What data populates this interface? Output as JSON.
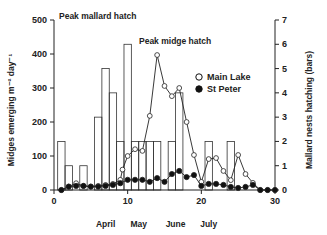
{
  "chart_data": {
    "type": "bar+line",
    "title": "",
    "xlabel": "",
    "ylabel": "Midges emerging m⁻² day⁻¹",
    "y2label": "Mallard nests hatching (bars)",
    "xlim": [
      0,
      30
    ],
    "ylim": [
      0,
      500
    ],
    "y2lim": [
      0,
      7
    ],
    "x_ticks": [
      0,
      10,
      20,
      30
    ],
    "y_ticks": [
      0,
      100,
      200,
      300,
      400,
      500
    ],
    "y2_ticks": [
      0,
      1,
      2,
      3,
      4,
      5,
      6,
      7
    ],
    "month_labels": [
      {
        "label": "April",
        "x": 7
      },
      {
        "label": "May",
        "x": 11.5
      },
      {
        "label": "June",
        "x": 16.5
      },
      {
        "label": "July",
        "x": 21
      }
    ],
    "annotations": [
      {
        "text": "Peak mallard hatch",
        "x": 0.3,
        "y": 500
      },
      {
        "text": "Peak midge hatch",
        "x": 10.5,
        "y": 430
      }
    ],
    "legend": {
      "position": "right",
      "entries": [
        {
          "label": "Main Lake",
          "marker": "open-circle"
        },
        {
          "label": "St Peter",
          "marker": "filled-circle"
        }
      ]
    },
    "bars": {
      "name": "Mallard nests hatching",
      "axis": "right",
      "x": [
        1,
        2,
        4,
        6,
        7,
        8,
        9,
        10,
        11,
        12,
        13,
        14,
        16,
        17,
        21,
        24
      ],
      "values": [
        2,
        1,
        1,
        3,
        5,
        4,
        2,
        6,
        2,
        2,
        2,
        2,
        2,
        4,
        2,
        2
      ]
    },
    "series": [
      {
        "name": "Main Lake",
        "marker": "open-circle",
        "x": [
          1,
          2,
          3,
          4,
          5,
          6,
          7,
          8,
          9,
          9.3,
          10,
          11,
          12,
          13,
          14,
          15,
          16,
          17,
          18,
          19,
          20,
          21,
          22,
          23,
          24,
          25,
          26,
          27,
          28,
          29,
          30
        ],
        "values": [
          0,
          10,
          20,
          12,
          10,
          12,
          15,
          18,
          30,
          60,
          100,
          120,
          115,
          218,
          397,
          306,
          276,
          300,
          200,
          103,
          24,
          91,
          94,
          56,
          29,
          103,
          47,
          21,
          0,
          0,
          0
        ]
      },
      {
        "name": "St Peter",
        "marker": "filled-circle",
        "x": [
          1,
          2,
          3,
          4,
          5,
          6,
          7,
          8,
          9,
          10,
          11,
          12,
          13,
          14,
          15,
          16,
          17,
          18,
          19,
          20,
          21,
          22,
          23,
          24,
          25,
          26,
          27,
          28,
          29,
          30
        ],
        "values": [
          0,
          10,
          12,
          12,
          10,
          10,
          12,
          15,
          20,
          30,
          30,
          30,
          24,
          35,
          24,
          47,
          56,
          38,
          44,
          12,
          18,
          18,
          15,
          9,
          6,
          9,
          15,
          0,
          0,
          0
        ]
      }
    ]
  }
}
